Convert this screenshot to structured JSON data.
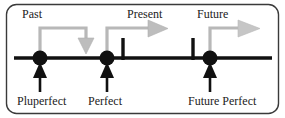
{
  "diagram": {
    "frame": {
      "stroke": "#3a3a3a",
      "radius": 10
    },
    "colors": {
      "axis": "#111111",
      "marker": "#111111",
      "pointer_arrow": "#111111",
      "era_arrow": "#b3b3b3",
      "text": "#222222",
      "background": "#ffffff"
    },
    "axis": {
      "label": "time axis",
      "y": 58
    },
    "era_labels": [
      {
        "id": "past",
        "text": "Past"
      },
      {
        "id": "present",
        "text": "Present"
      },
      {
        "id": "future",
        "text": "Future"
      }
    ],
    "era_arrows": [
      {
        "id": "past-arrow",
        "direction": "down",
        "origin": "pluperfect-marker"
      },
      {
        "id": "present-arrow",
        "direction": "right",
        "origin": "perfect-marker"
      },
      {
        "id": "future-arrow",
        "direction": "right",
        "origin": "future-perfect-marker"
      }
    ],
    "markers": [
      {
        "id": "pluperfect",
        "x": 40,
        "shape": "filled-circle"
      },
      {
        "id": "perfect",
        "x": 107,
        "shape": "filled-circle"
      },
      {
        "id": "future-perfect",
        "x": 210,
        "shape": "filled-circle"
      }
    ],
    "ticks": [
      {
        "id": "present-tick",
        "x": 123
      },
      {
        "id": "future-tick",
        "x": 193
      }
    ],
    "tense_labels": [
      {
        "id": "pluperfect",
        "text": "Pluperfect",
        "points_to": "pluperfect-marker"
      },
      {
        "id": "perfect",
        "text": "Perfect",
        "points_to": "perfect-marker"
      },
      {
        "id": "future-perfect",
        "text": "Future Perfect",
        "points_to": "future-perfect-marker"
      }
    ]
  }
}
